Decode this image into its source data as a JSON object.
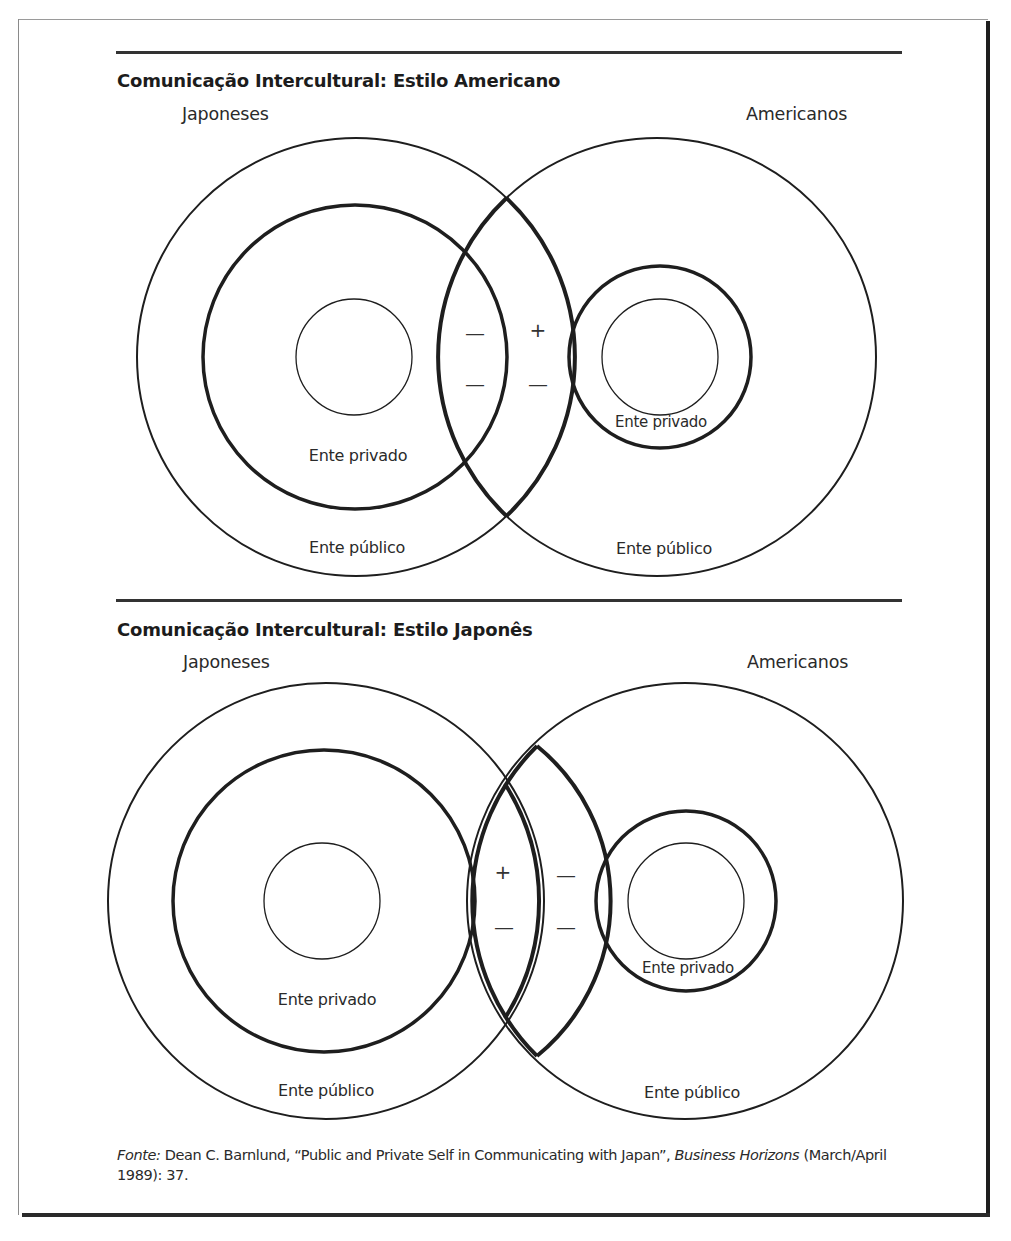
{
  "figure": {
    "top_panel": {
      "title": "Comunicação Intercultural: Estilo Americano",
      "left_group": "Japoneses",
      "right_group": "Americanos",
      "left_private_label": "Ente privado",
      "left_public_label": "Ente público",
      "right_private_label": "Ente privado",
      "right_public_label": "Ente público",
      "overlap_signs": {
        "left_column": [
          "—",
          "—"
        ],
        "right_column": [
          "+",
          "—"
        ]
      }
    },
    "bottom_panel": {
      "title": "Comunicação Intercultural: Estilo Japonês",
      "left_group": "Japoneses",
      "right_group": "Americanos",
      "left_private_label": "Ente privado",
      "left_public_label": "Ente público",
      "right_private_label": "Ente privado",
      "right_public_label": "Ente público",
      "overlap_signs": {
        "left_column": [
          "+",
          "—"
        ],
        "right_column": [
          "—",
          "—"
        ]
      }
    },
    "source": {
      "prefix": "Fonte:",
      "text_before_journal": " Dean C. Barnlund, “Public and Private Self in Communicating with Japan”, ",
      "journal": "Business Horizons",
      "text_after_journal": " (March/April 1989): 37."
    }
  },
  "colors": {
    "line": "#1e1e1e",
    "text": "#2a2a2a",
    "background": "#ffffff"
  }
}
